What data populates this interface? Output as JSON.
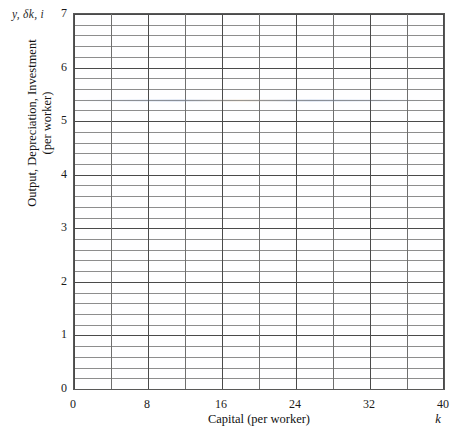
{
  "figure": {
    "corner_label": "y, δk, i",
    "background_color": "#ffffff",
    "plot_background_color": "#fefeff",
    "frame_color": "#585858",
    "major_grid_color": "#4a4a4a",
    "minor_grid_color": "#8d8d8d"
  },
  "axes": {
    "x_title": "Capital (per worker)",
    "x_variable": "k",
    "y_title_line1": "Output, Depreciation, Investment",
    "y_title_line2": "(per worker)"
  },
  "chart_data": {
    "type": "line",
    "title": "",
    "subtitle": "",
    "xlabel": "Capital (per worker)",
    "ylabel": "Output, Depreciation, Investment (per worker)",
    "x_variable_symbol": "k",
    "y_variable_symbols": "y, δk, i",
    "xlim": [
      0,
      40
    ],
    "ylim": [
      0,
      7
    ],
    "xticks": [
      0,
      8,
      16,
      24,
      32,
      40
    ],
    "xtick_labels": [
      "0",
      "8",
      "16",
      "24",
      "32",
      "40"
    ],
    "yticks": [
      0,
      1,
      2,
      3,
      4,
      5,
      6,
      7
    ],
    "ytick_labels": [
      "0",
      "1",
      "2",
      "3",
      "4",
      "5",
      "6",
      "7"
    ],
    "x_major_gridlines": [
      0,
      4,
      8,
      12,
      16,
      20,
      24,
      28,
      32,
      36,
      40
    ],
    "x_minor_gridlines": [],
    "y_major_gridlines": [
      0,
      1,
      2,
      3,
      4,
      5,
      6,
      7
    ],
    "y_minor_gridline_step": 0.2,
    "grid": true,
    "legend": "none",
    "series": [],
    "annotations": []
  }
}
